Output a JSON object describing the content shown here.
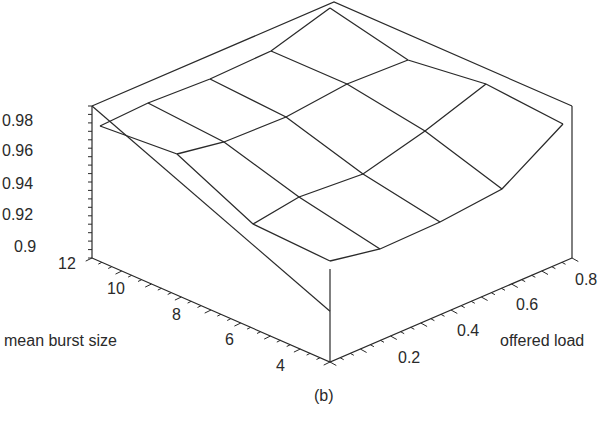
{
  "chart_data": {
    "type": "surface3d",
    "caption": "(b)",
    "zlabel": "",
    "xlabel": "mean burst size",
    "ylabel": "offered load",
    "z_ticks": [
      "0.9",
      "0.92",
      "0.94",
      "0.96",
      "0.98"
    ],
    "burst_ticks": [
      "12",
      "10",
      "8",
      "6",
      "4"
    ],
    "load_ticks": [
      "0.2",
      "0.4",
      "0.6",
      "0.8"
    ],
    "zlim": [
      0.9,
      0.99
    ],
    "burst_values": [
      12,
      9.3,
      6.7,
      4
    ],
    "load_values": [
      0.1,
      0.3,
      0.5,
      0.7,
      0.9
    ],
    "z": [
      [
        0.981,
        0.986,
        0.988,
        0.989,
        0.99
      ],
      [
        0.971,
        0.973,
        0.975,
        0.976,
        0.977
      ],
      [
        0.945,
        0.948,
        0.952,
        0.958,
        0.97
      ],
      [
        0.92,
        0.924,
        0.93,
        0.94,
        0.979
      ]
    ],
    "grid": false,
    "legend": null
  },
  "labels": {
    "z_ticks": [
      {
        "text": "0.98",
        "x": 2,
        "y": 112
      },
      {
        "text": "0.96",
        "x": 2,
        "y": 142
      },
      {
        "text": "0.94",
        "x": 2,
        "y": 175
      },
      {
        "text": "0.92",
        "x": 2,
        "y": 206
      },
      {
        "text": "0.9",
        "x": 14,
        "y": 238
      }
    ],
    "burst_ticks": [
      {
        "text": "12",
        "x": 58,
        "y": 255
      },
      {
        "text": "10",
        "x": 107,
        "y": 280
      },
      {
        "text": "8",
        "x": 172,
        "y": 306
      },
      {
        "text": "6",
        "x": 225,
        "y": 331
      },
      {
        "text": "4",
        "x": 276,
        "y": 357
      }
    ],
    "load_ticks": [
      {
        "text": "0.2",
        "x": 398,
        "y": 349
      },
      {
        "text": "0.4",
        "x": 457,
        "y": 322
      },
      {
        "text": "0.6",
        "x": 516,
        "y": 296
      },
      {
        "text": "0.8",
        "x": 575,
        "y": 271
      }
    ],
    "burst_title": {
      "text": "mean burst size",
      "x": 4,
      "y": 332
    },
    "load_title": {
      "text": "offered load",
      "x": 500,
      "y": 332
    },
    "caption": {
      "text": "(b)",
      "x": 314,
      "y": 387
    }
  }
}
